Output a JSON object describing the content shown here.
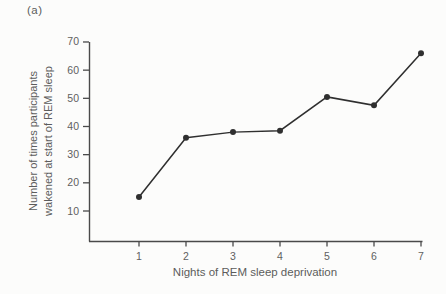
{
  "figure": {
    "panel_label": "(a)"
  },
  "chart_data": {
    "type": "line",
    "x": [
      1,
      2,
      3,
      4,
      5,
      6,
      7
    ],
    "values": [
      15,
      36,
      38,
      38.5,
      50.5,
      47.5,
      66
    ],
    "title": "",
    "xlabel": "Nights of REM sleep deprivation",
    "ylabel": "Number of times participants wakened at start of REM sleep",
    "ylabel_lines": [
      "Number of times participants",
      "wakened at start of REM sleep"
    ],
    "x_ticks": [
      1,
      2,
      3,
      4,
      5,
      6,
      7
    ],
    "y_ticks": [
      10,
      20,
      30,
      40,
      50,
      60,
      70
    ],
    "ylim": [
      0,
      70
    ],
    "grid": false,
    "legend": "none",
    "marker": "filled-circle",
    "line_color": "#2f2f2f",
    "axis_color": "#4a4a4a",
    "text_color": "#5f5f5f",
    "background_color": "#fcfcfb"
  }
}
